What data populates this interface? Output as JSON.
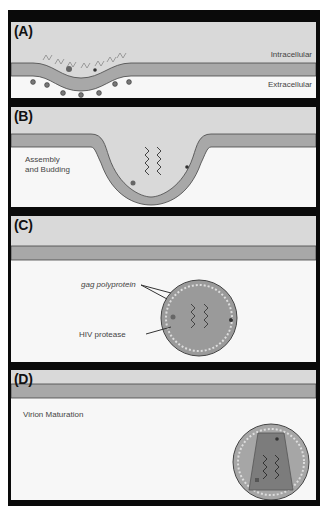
{
  "figure": {
    "colors": {
      "frame": "#0a0a0a",
      "intracellular": "#d9d9d9",
      "membrane": "#a8a8a8",
      "extracellular": "#f7f7f7",
      "virion_fill": "#9a9a9a",
      "capsid_fill": "#7c7c7c",
      "spike": "#555555"
    },
    "panels": [
      {
        "id": "A",
        "label": "(A)",
        "texts": {
          "top_right": "Intracellular",
          "bottom_right": "Extracellular"
        }
      },
      {
        "id": "B",
        "label": "(B)",
        "texts": {
          "stage": "Assembly\nand Budding"
        }
      },
      {
        "id": "C",
        "label": "(C)",
        "texts": {
          "gag": "gag polyprotein",
          "protease": "HIV protease"
        }
      },
      {
        "id": "D",
        "label": "(D)",
        "texts": {
          "stage": "Virion Maturation"
        }
      }
    ]
  }
}
